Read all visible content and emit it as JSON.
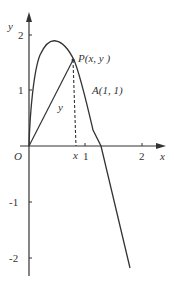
{
  "axes": {
    "x_label": "x",
    "y_label": "y",
    "origin_label": "O",
    "x_ticks": [
      "1",
      "2"
    ],
    "y_ticks": [
      "2",
      "1",
      "-1",
      "-2"
    ]
  },
  "annotations": {
    "point_p": "P(x,  y )",
    "point_a": "A(1,  1)",
    "segment_y": "y",
    "foot_x": "x"
  },
  "colors": {
    "stroke": "#333333",
    "background": "#ffffff"
  }
}
